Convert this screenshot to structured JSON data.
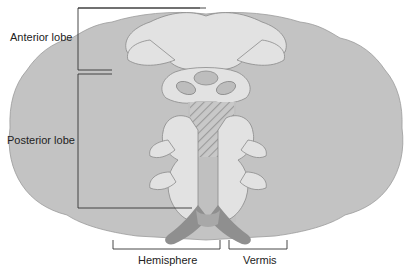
{
  "diagram": {
    "labels": {
      "anterior_lobe": "Anterior lobe",
      "posterior_lobe": "Posterior lobe",
      "hemisphere": "Hemisphere",
      "vermis": "Vermis"
    },
    "colors": {
      "hemisphere_fill": "#c3c3c3",
      "vermis_light": "#e2e2e2",
      "nucleus_fill": "#bdbdbd",
      "peduncle_fill": "#8f8f8f",
      "hatch": "#9a9a9a",
      "outline": "#8a8a8a",
      "bracket": "#333333"
    }
  }
}
